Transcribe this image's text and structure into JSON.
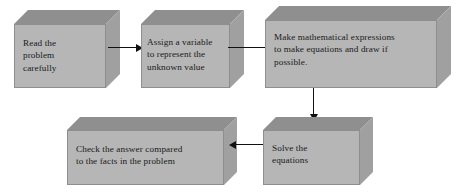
{
  "diagram": {
    "style": {
      "box_front_color": "#b6b6b6",
      "box_top_color": "#8f8f8f",
      "box_side_color": "#a0a0a0",
      "box_border_color": "#8e8e8e",
      "arrow_color": "#111111",
      "text_color": "#1a1a1a",
      "background_color": "#ffffff"
    },
    "nodes": [
      {
        "id": "read-problem",
        "text": "Read the\nproblem\ncarefully"
      },
      {
        "id": "assign-variable",
        "text": "Assign a variable\nto represent the\nunknown value"
      },
      {
        "id": "make-expressions",
        "text": "Make mathematical expressions\nto make equations and draw if\npossible."
      },
      {
        "id": "solve-equations",
        "text": "Solve the\nequations"
      },
      {
        "id": "check-answer",
        "text": "Check the answer compared\nto the facts in the problem"
      }
    ],
    "edges": [
      {
        "id": "edge-read-to-assign",
        "from": "read-problem",
        "to": "assign-variable",
        "direction": "right"
      },
      {
        "id": "edge-assign-to-expressions",
        "from": "assign-variable",
        "to": "make-expressions",
        "direction": "right"
      },
      {
        "id": "edge-expressions-to-solve",
        "from": "make-expressions",
        "to": "solve-equations",
        "direction": "down"
      },
      {
        "id": "edge-solve-to-check",
        "from": "solve-equations",
        "to": "check-answer",
        "direction": "left"
      }
    ]
  }
}
